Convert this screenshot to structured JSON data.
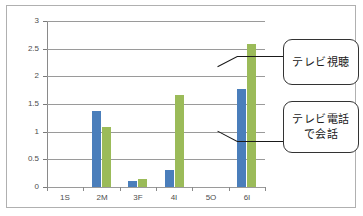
{
  "chart_data": {
    "type": "bar",
    "title": "",
    "xlabel": "",
    "ylabel": "",
    "categories": [
      "1S",
      "2M",
      "3F",
      "4I",
      "5O",
      "6I"
    ],
    "series": [
      {
        "name": "テレビ電話で会話",
        "color": "#4a7ebb",
        "values": [
          0,
          1.37,
          0.1,
          0.3,
          0,
          1.78
        ]
      },
      {
        "name": "テレビ視聴",
        "color": "#9bbb59",
        "values": [
          0,
          1.09,
          0.15,
          1.67,
          0,
          2.58
        ]
      }
    ],
    "ylim": [
      0,
      3
    ],
    "yticks": [
      "0",
      "0.5",
      "1",
      "1.5",
      "2",
      "2.5",
      "3"
    ],
    "ytick_values": [
      0,
      0.5,
      1,
      1.5,
      2,
      2.5,
      3
    ],
    "grid": true,
    "legend": "none"
  },
  "callouts": {
    "tv_view": {
      "label": "テレビ視聴",
      "lines": [
        "テレビ視聴"
      ]
    },
    "tv_phone": {
      "label": "テレビ電話で会話",
      "line1": "テレビ電話",
      "line2": "で会話"
    }
  }
}
